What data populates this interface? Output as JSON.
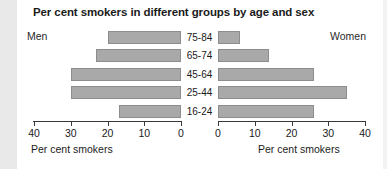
{
  "title": "Per cent smokers in different groups by age and sex",
  "left_side_label": "Men",
  "right_side_label": "Women",
  "left_axis_caption": "Per cent smokers",
  "right_axis_caption": "Per cent smokers",
  "left_axis_ticks": [
    "40",
    "30",
    "20",
    "10",
    "0"
  ],
  "right_axis_ticks": [
    "0",
    "10",
    "20",
    "30",
    "40"
  ],
  "age_groups": [
    "75-84",
    "65-74",
    "45-64",
    "25-44",
    "16-24"
  ],
  "colors": {
    "bar_fill": "#a9a9a9",
    "bar_border": "#8d8d8d",
    "text": "#1b1b1b",
    "axis": "#3a3a3a",
    "background": "#ffffff"
  },
  "chart_data": {
    "type": "bar",
    "title": "Per cent smokers in different groups by age and sex",
    "subtitle": "",
    "orientation": "horizontal",
    "layout": "population-pyramid",
    "categories": [
      "75-84",
      "65-74",
      "45-64",
      "25-44",
      "16-24"
    ],
    "xlabel": "Per cent smokers",
    "ylabel": "",
    "xlim": [
      0,
      40
    ],
    "grid": false,
    "legend": "none",
    "series": [
      {
        "name": "Men",
        "side": "left",
        "axis_direction": "reversed",
        "axis_ticks": [
          40,
          30,
          20,
          10,
          0
        ],
        "values": [
          20,
          23,
          30,
          30,
          17
        ]
      },
      {
        "name": "Women",
        "side": "right",
        "axis_direction": "normal",
        "axis_ticks": [
          0,
          10,
          20,
          30,
          40
        ],
        "values": [
          6,
          14,
          26,
          35,
          26
        ]
      }
    ],
    "annotations": [
      "Men",
      "Women"
    ]
  }
}
